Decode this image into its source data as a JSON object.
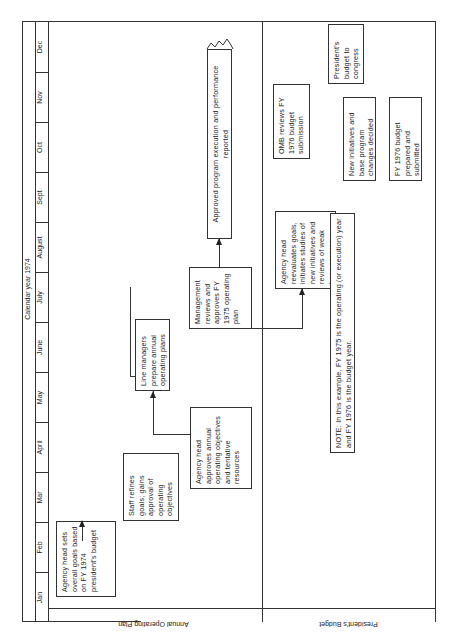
{
  "diagram": {
    "header": "Calendar year 1974",
    "months": [
      "Jan",
      "Feb",
      "Mar",
      "April",
      "May",
      "June",
      "July",
      "August",
      "Sept",
      "Oct",
      "Nov",
      "Dec"
    ],
    "rows": {
      "top": "Annual Operating Plan",
      "bottom": "President's Budget"
    },
    "boxes": {
      "agency_sets_goals": "Agency head sets overall goals based on FY 1974 president's budget",
      "staff_refines": "Staff refines goals; gains approval of operating objectives",
      "agency_approves": "Agency head approves annual operating objectives and tentative resources",
      "line_managers": "Line managers prepare annual operating plans",
      "management_reviews": "Management reviews and approves FY 1975 operating plan",
      "execution": "Approved program execution and performance reported",
      "agency_reevaluates": "Agency head reevaluates goals, initiates studies of new initiatives and reviews of weak base programs",
      "new_initiatives": "New initiatives and base program changes decided",
      "fy1976_budget": "FY 1976 budget prepared and submitted",
      "omb_reviews": "OMB reviews FY 1976 budget submission",
      "presidents_budget": "President's budget to congress"
    },
    "note": "NOTE: In this example, FY 1975 is the operating (or execution) year and FY 1976 is the budget year."
  }
}
